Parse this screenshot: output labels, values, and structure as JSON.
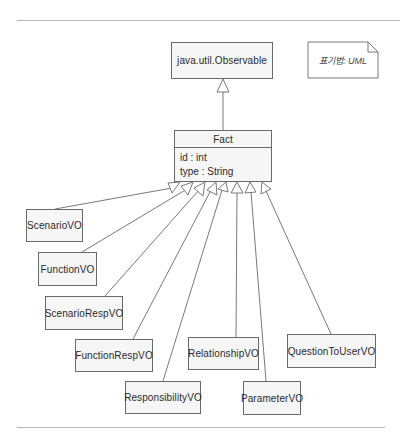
{
  "diagram": {
    "notation_note": "표기법: UML",
    "superclass": {
      "name": "java.util.Observable"
    },
    "base_class": {
      "name": "Fact",
      "attributes": [
        "id : int",
        "type : String"
      ]
    },
    "subclasses": [
      {
        "name": "ScenarioVO"
      },
      {
        "name": "FunctionVO"
      },
      {
        "name": "ScenarioRespVO"
      },
      {
        "name": "FunctionRespVO"
      },
      {
        "name": "ResponsibilityVO"
      },
      {
        "name": "RelationshipVO"
      },
      {
        "name": "ParameterVO"
      },
      {
        "name": "QuestionToUserVO"
      }
    ],
    "relationship": "generalization",
    "colors": {
      "line": "#6a6a6a",
      "box_fill": "#f6f6f6",
      "rule": "#b5b5b5"
    }
  }
}
